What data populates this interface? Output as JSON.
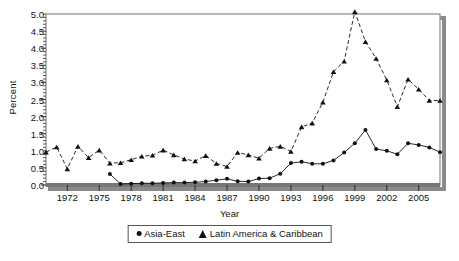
{
  "chart_data": {
    "type": "line",
    "title": "",
    "xlabel": "Year",
    "ylabel": "Percent",
    "xlim": [
      1970,
      2007
    ],
    "ylim": [
      0.0,
      5.0
    ],
    "grid": false,
    "legend_position": "bottom",
    "x": [
      1970,
      1971,
      1972,
      1973,
      1974,
      1975,
      1976,
      1977,
      1978,
      1979,
      1980,
      1981,
      1982,
      1983,
      1984,
      1985,
      1986,
      1987,
      1988,
      1989,
      1990,
      1991,
      1992,
      1993,
      1994,
      1995,
      1996,
      1997,
      1998,
      1999,
      2000,
      2001,
      2002,
      2003,
      2004,
      2005,
      2006,
      2007
    ],
    "xticks": [
      1972,
      1975,
      1978,
      1981,
      1984,
      1987,
      1990,
      1993,
      1996,
      1999,
      2002,
      2005
    ],
    "xticklabels": [
      "1972",
      "1975",
      "1978",
      "1981",
      "1984",
      "1987",
      "1990",
      "1993",
      "1996",
      "1999",
      "2002",
      "2005"
    ],
    "yticks": [
      0.0,
      0.5,
      1.0,
      1.5,
      2.0,
      2.5,
      3.0,
      3.5,
      4.0,
      4.5,
      5.0
    ],
    "yticklabels": [
      "0.0",
      "0.5",
      "1.0",
      "1.5",
      "2.0",
      "2.5",
      "3.0",
      "3.5",
      "4.0",
      "4.5",
      "5.0"
    ],
    "series": [
      {
        "name": "Asia-East",
        "marker": "circle",
        "color": "#111111",
        "x": [
          1976,
          1977,
          1978,
          1979,
          1980,
          1981,
          1982,
          1983,
          1984,
          1985,
          1986,
          1987,
          1988,
          1989,
          1990,
          1991,
          1992,
          1993,
          1994,
          1995,
          1996,
          1997,
          1998,
          1999,
          2000,
          2001,
          2002,
          2003,
          2004,
          2005,
          2006,
          2007
        ],
        "values": [
          0.32,
          0.03,
          0.04,
          0.05,
          0.05,
          0.06,
          0.07,
          0.07,
          0.08,
          0.1,
          0.14,
          0.18,
          0.11,
          0.1,
          0.19,
          0.2,
          0.33,
          0.64,
          0.68,
          0.62,
          0.62,
          0.72,
          0.95,
          1.22,
          1.61,
          1.05,
          1.0,
          0.9,
          1.22,
          1.17,
          1.1,
          0.96
        ]
      },
      {
        "name": "Latin America & Caribbean",
        "marker": "triangle",
        "color": "#111111",
        "x": [
          1970,
          1971,
          1972,
          1973,
          1974,
          1975,
          1976,
          1977,
          1978,
          1979,
          1980,
          1981,
          1982,
          1983,
          1984,
          1985,
          1986,
          1987,
          1988,
          1989,
          1990,
          1991,
          1992,
          1993,
          1994,
          1995,
          1996,
          1997,
          1998,
          1999,
          2000,
          2001,
          2002,
          2003,
          2004,
          2005,
          2006,
          2007
        ],
        "values": [
          0.96,
          1.11,
          0.47,
          1.13,
          0.8,
          1.02,
          0.64,
          0.65,
          0.74,
          0.84,
          0.87,
          1.02,
          0.88,
          0.76,
          0.7,
          0.86,
          0.63,
          0.54,
          0.95,
          0.88,
          0.78,
          1.07,
          1.13,
          0.98,
          1.7,
          1.81,
          2.42,
          3.31,
          3.62,
          5.07,
          4.19,
          3.7,
          3.07,
          2.29,
          3.09,
          2.8,
          2.47,
          2.47
        ]
      }
    ]
  },
  "legend": {
    "entries": [
      {
        "label": "Asia-East",
        "marker": "circle"
      },
      {
        "label": "Latin America & Caribbean",
        "marker": "triangle"
      }
    ]
  },
  "axes": {
    "x_title": "Year",
    "y_title": "Percent"
  }
}
